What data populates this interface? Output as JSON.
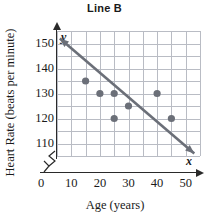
{
  "chart_data": {
    "type": "scatter",
    "title": "Line B",
    "xlabel": "Age (years)",
    "ylabel": "Heart Rate (beats per minute)",
    "xlim": [
      0,
      55
    ],
    "ylim": [
      105,
      155
    ],
    "xticks": [
      0,
      10,
      20,
      30,
      40,
      50
    ],
    "yticks": [
      110,
      120,
      130,
      140,
      150
    ],
    "grid": true,
    "grid_step_x": 5,
    "grid_step_y": 5,
    "axis_break_x": true,
    "axis_break_y": true,
    "x_axis_variable": "x",
    "y_axis_variable": "y",
    "legend": "none",
    "points": [
      {
        "x": 15,
        "y": 135
      },
      {
        "x": 20,
        "y": 130
      },
      {
        "x": 25,
        "y": 130
      },
      {
        "x": 25,
        "y": 120
      },
      {
        "x": 30,
        "y": 125
      },
      {
        "x": 40,
        "y": 130
      },
      {
        "x": 45,
        "y": 120
      }
    ],
    "series": [
      {
        "name": "Line B",
        "type": "line",
        "double_arrow": true,
        "x": [
          6,
          53
        ],
        "values": [
          152,
          106
        ],
        "color": "#6b6f78"
      }
    ],
    "point_color": "#6b6f78",
    "grid_color": "#b9bcc4",
    "axis_color": "#2a2a2a"
  }
}
